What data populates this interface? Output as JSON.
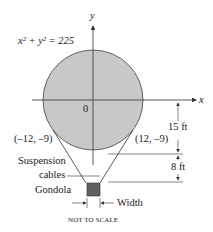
{
  "diagram": {
    "equation": "x² + y² = 225",
    "axis_x_label": "x",
    "axis_y_label": "y",
    "origin_label": "0",
    "point_left": "(–12, –9)",
    "point_right": "(12, –9)",
    "dim_upper": "15 ft",
    "dim_lower": "8 ft",
    "cables_label_line1": "Suspension",
    "cables_label_line2": "cables",
    "gondola_label": "Gondola",
    "width_label": "Width",
    "footnote": "NOT TO SCALE",
    "colors": {
      "balloon_fill": "#c8c8c8",
      "gondola_fill": "#606060",
      "line": "#333333"
    }
  }
}
